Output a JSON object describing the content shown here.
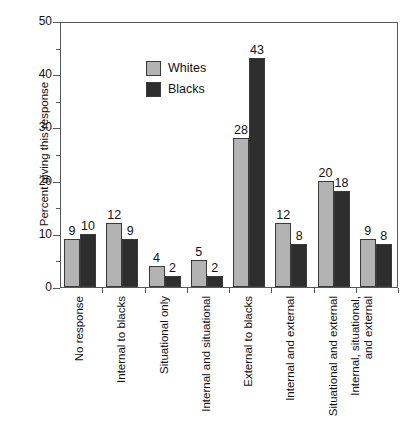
{
  "chart_data": {
    "type": "bar",
    "title": "",
    "xlabel": "",
    "ylabel": "Percent giving this response",
    "ylim": [
      0,
      50
    ],
    "yticks": [
      0,
      10,
      20,
      30,
      40,
      50
    ],
    "yticks_minor": [
      5,
      15,
      25,
      35,
      45
    ],
    "grid": false,
    "legend_position": "top-left",
    "categories": [
      "No response",
      "Internal to blacks",
      "Situational only",
      "Internal and situational",
      "External to blacks",
      "Internal and external",
      "Situational and external",
      "Internal, situational, and external"
    ],
    "series": [
      {
        "name": "Whites",
        "color": "#b3b3b3",
        "values": [
          9,
          12,
          4,
          5,
          28,
          12,
          20,
          9
        ]
      },
      {
        "name": "Blacks",
        "color": "#2e2e2e",
        "values": [
          10,
          9,
          2,
          2,
          43,
          8,
          18,
          8
        ]
      }
    ],
    "value_labels_shown": true
  },
  "legend": {
    "items": [
      {
        "label": "Whites",
        "swatch": "#b3b3b3"
      },
      {
        "label": "Blacks",
        "swatch": "#2e2e2e"
      }
    ]
  },
  "axis": {
    "y_title": "Percent giving this response",
    "y_tick_labels": [
      "50",
      "40",
      "30",
      "20",
      "10",
      "0"
    ],
    "x_tick_labels": [
      "No response",
      "Internal to blacks",
      "Situational only",
      "Internal and situational",
      "External to blacks",
      "Internal and external",
      "Situational and external",
      "Internal, situational,|and external"
    ]
  }
}
